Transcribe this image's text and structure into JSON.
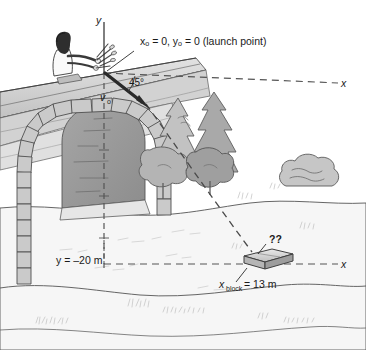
{
  "figure": {
    "axes": {
      "y_axis_label": "y",
      "x_axis_upper_label": "x",
      "x_axis_lower_label": "x"
    },
    "annotations": {
      "launch_point": "xₒ = 0, yₒ = 0 (launch point)",
      "angle": "45°",
      "velocity_symbol": "v",
      "velocity_subscript": "o",
      "drop_height": "y = –20 m",
      "block_distance_symbol": "x",
      "block_distance_subscript": "block",
      "block_distance_value": " = 13 m",
      "unknown_marker": "??"
    },
    "scene_objects": {
      "person": "person-launching-projectile",
      "cliff": "sloped-cliff-top",
      "archway": "stone-block-archway",
      "trees": "conifer-tree-cluster",
      "bush": "shrub",
      "block": "target-block",
      "river": "river-bank"
    },
    "colors": {
      "ink": "#1a1a1a",
      "stone_fill": "#c9c9c9",
      "stone_dark": "#8f8f8f",
      "arch_interior": "#9a9a9a",
      "tree_light": "#c4c4c4",
      "tree_mid": "#ababab",
      "tree_dark": "#9b9b9b",
      "cliff_band": "#d8d8d8",
      "cliff_shadow": "#bdbdbd",
      "ground": "#f4f4f4",
      "dash": "#4a4a4a",
      "texture": "#cfcfcf"
    }
  }
}
